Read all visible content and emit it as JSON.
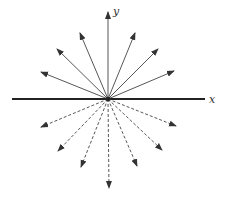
{
  "diagram": {
    "axis_labels": {
      "x": "x",
      "y": "y"
    },
    "origin": [
      108,
      99
    ],
    "x_axis": {
      "from": [
        12,
        99
      ],
      "to": [
        205,
        99
      ]
    },
    "y_axis": {
      "from": [
        108,
        99
      ],
      "to": [
        108,
        12
      ]
    },
    "solid_rays_upper": [
      [
        80,
        33
      ],
      [
        57,
        49
      ],
      [
        41,
        72
      ],
      [
        135,
        33
      ],
      [
        158,
        49
      ],
      [
        174,
        71
      ]
    ],
    "dashed_rays_lower": [
      [
        41,
        127
      ],
      [
        58,
        151
      ],
      [
        81,
        167
      ],
      [
        109,
        188
      ],
      [
        137,
        166
      ],
      [
        162,
        150
      ],
      [
        176,
        126
      ]
    ],
    "colors": {
      "line": "#444444",
      "axis": "#222222"
    }
  }
}
